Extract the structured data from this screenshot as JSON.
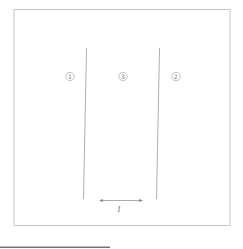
{
  "diagram": {
    "regions": [
      {
        "id": "region-left",
        "label": "1"
      },
      {
        "id": "region-middle",
        "label": "3"
      },
      {
        "id": "region-right",
        "label": "2"
      }
    ],
    "dimension": {
      "label": "l"
    },
    "colors": {
      "frame": "#b8b8b8",
      "lines": "#999999",
      "circle": "#999999",
      "arrow": "#888888",
      "bottom_bar": "#777777"
    }
  }
}
